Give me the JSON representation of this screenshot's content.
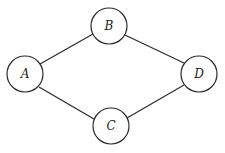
{
  "diagram": {
    "type": "graph",
    "nodes": [
      {
        "id": "A",
        "label": "A",
        "x": 25,
        "y": 74,
        "r": 18
      },
      {
        "id": "B",
        "label": "B",
        "x": 109,
        "y": 26,
        "r": 18
      },
      {
        "id": "C",
        "label": "C",
        "x": 111,
        "y": 126,
        "r": 18
      },
      {
        "id": "D",
        "label": "D",
        "x": 199,
        "y": 74,
        "r": 18
      }
    ],
    "edges": [
      {
        "from": "A",
        "to": "B"
      },
      {
        "from": "A",
        "to": "C"
      },
      {
        "from": "B",
        "to": "D"
      },
      {
        "from": "C",
        "to": "D"
      }
    ]
  }
}
